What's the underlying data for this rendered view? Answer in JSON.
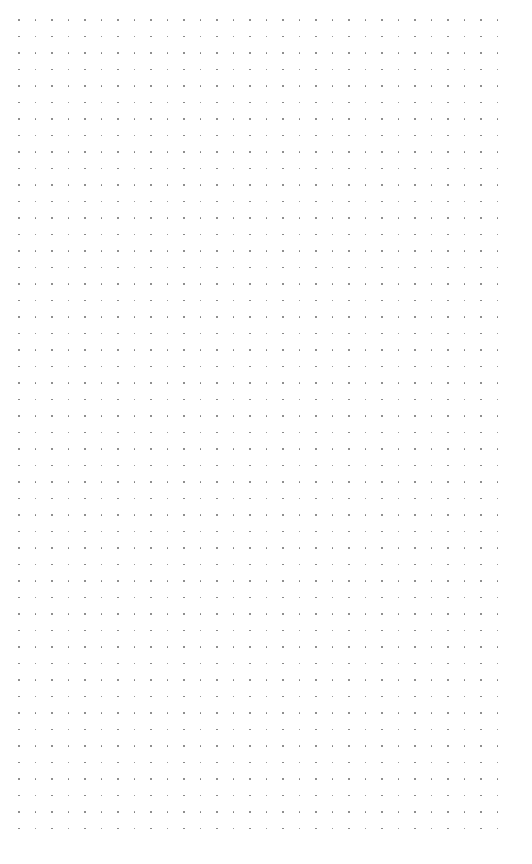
{
  "canvas": {
    "width": 532,
    "height": 864,
    "background": "#ffffff"
  },
  "dot_grid": {
    "columns": 30,
    "rows": 50,
    "origin_x": 19,
    "origin_y": 20,
    "spacing_x": 16.5,
    "spacing_y": 16.5,
    "dot_size": 1.5,
    "dot_color": "#7a7a7a"
  }
}
